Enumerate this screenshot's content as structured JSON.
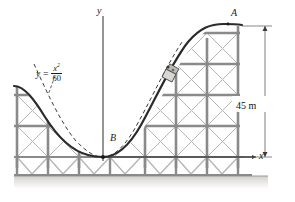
{
  "figure": {
    "labels": {
      "y_axis": "y",
      "x_axis": "x",
      "point_a": "A",
      "point_b": "B",
      "dimension": "45 m",
      "equation_lhs": "y =",
      "equation_numerator": "x",
      "equation_numerator_exp": "2",
      "equation_denominator": "60"
    },
    "colors": {
      "curve": "#2b2b2b",
      "dashed_curve": "#3a3a3a",
      "truss_post": "#8a8a8a",
      "truss_diagonal": "#b4b4b4",
      "axis": "#2b2b2b",
      "ground": "#d8d6d2"
    },
    "geometry": {
      "origin_x": 103,
      "origin_y": 157,
      "curve_equation": "y = x^2 / 60",
      "height_label_value": 45,
      "height_label_unit": "m"
    }
  }
}
